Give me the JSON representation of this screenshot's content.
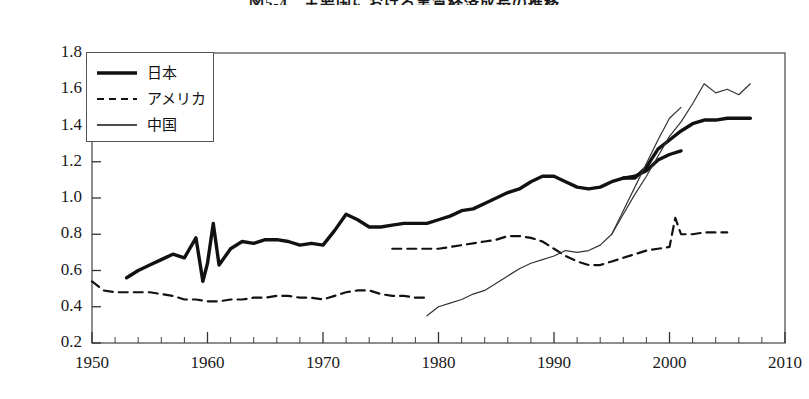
{
  "chart_data": {
    "type": "line",
    "title": "図5-4　主要国における実質経済成長の推移",
    "xlabel": "",
    "ylabel": "",
    "xlim": [
      1950,
      2010
    ],
    "ylim": [
      0.2,
      1.8
    ],
    "x_ticks": [
      1950,
      1960,
      1970,
      1980,
      1990,
      2000,
      2010
    ],
    "x_tick_labels": [
      "1950",
      "1960",
      "1970",
      "1980",
      "1990",
      "2000",
      "2010"
    ],
    "x_minor_tick_step": 2,
    "y_ticks": [
      0.2,
      0.4,
      0.6,
      0.8,
      1.0,
      1.2,
      1.4,
      1.6,
      1.8
    ],
    "y_tick_labels": [
      "0.2",
      "0.4",
      "0.6",
      "0.8",
      "1.0",
      "1.2",
      "1.4",
      "1.6",
      "1.8"
    ],
    "grid": false,
    "legend_position": "upper-left",
    "series": [
      {
        "name": "日本",
        "style": "solid-thick",
        "color": "#111111",
        "width": 3.4,
        "points": [
          [
            1953,
            0.56
          ],
          [
            1954,
            0.6
          ],
          [
            1955,
            0.63
          ],
          [
            1956,
            0.66
          ],
          [
            1957,
            0.69
          ],
          [
            1958,
            0.67
          ],
          [
            1959,
            0.78
          ],
          [
            1959.6,
            0.54
          ],
          [
            1960,
            0.64
          ],
          [
            1960.5,
            0.86
          ],
          [
            1961,
            0.63
          ],
          [
            1962,
            0.72
          ],
          [
            1963,
            0.76
          ],
          [
            1964,
            0.75
          ],
          [
            1965,
            0.77
          ],
          [
            1966,
            0.77
          ],
          [
            1967,
            0.76
          ],
          [
            1968,
            0.74
          ],
          [
            1969,
            0.75
          ],
          [
            1970,
            0.74
          ],
          [
            1971,
            0.82
          ],
          [
            1972,
            0.91
          ],
          [
            1973,
            0.88
          ],
          [
            1974,
            0.84
          ],
          [
            1975,
            0.84
          ],
          [
            1976,
            0.85
          ],
          [
            1977,
            0.86
          ],
          [
            1978,
            0.86
          ],
          [
            1979,
            0.86
          ],
          [
            1980,
            0.88
          ],
          [
            1981,
            0.9
          ],
          [
            1982,
            0.93
          ],
          [
            1983,
            0.94
          ],
          [
            1984,
            0.97
          ],
          [
            1985,
            1.0
          ],
          [
            1986,
            1.03
          ],
          [
            1987,
            1.05
          ],
          [
            1988,
            1.09
          ],
          [
            1989,
            1.12
          ],
          [
            1990,
            1.12
          ],
          [
            1991,
            1.09
          ],
          [
            1992,
            1.06
          ],
          [
            1993,
            1.05
          ],
          [
            1994,
            1.06
          ],
          [
            1995,
            1.09
          ],
          [
            1996,
            1.11
          ],
          [
            1997,
            1.11
          ],
          [
            1998,
            1.17
          ],
          [
            1999,
            1.27
          ],
          [
            2000,
            1.32
          ],
          [
            2001,
            1.37
          ],
          [
            2002,
            1.41
          ],
          [
            2003,
            1.43
          ],
          [
            2004,
            1.43
          ],
          [
            2005,
            1.44
          ],
          [
            2006,
            1.44
          ],
          [
            2007,
            1.44
          ]
        ]
      },
      {
        "name": "日本",
        "style": "solid-thick",
        "color": "#111111",
        "width": 3.4,
        "points": [
          [
            1996,
            1.11
          ],
          [
            1997,
            1.12
          ],
          [
            1998,
            1.15
          ],
          [
            1999,
            1.21
          ],
          [
            2000,
            1.24
          ],
          [
            2001,
            1.26
          ]
        ]
      },
      {
        "name": "アメリカ",
        "style": "dashed",
        "color": "#111111",
        "width": 2.2,
        "points": [
          [
            1950,
            0.54
          ],
          [
            1951,
            0.49
          ],
          [
            1952,
            0.48
          ],
          [
            1953,
            0.48
          ],
          [
            1954,
            0.48
          ],
          [
            1955,
            0.48
          ],
          [
            1956,
            0.47
          ],
          [
            1957,
            0.46
          ],
          [
            1958,
            0.44
          ],
          [
            1959,
            0.44
          ],
          [
            1960,
            0.43
          ],
          [
            1961,
            0.43
          ],
          [
            1962,
            0.44
          ],
          [
            1963,
            0.44
          ],
          [
            1964,
            0.45
          ],
          [
            1965,
            0.45
          ],
          [
            1966,
            0.46
          ],
          [
            1967,
            0.46
          ],
          [
            1968,
            0.45
          ],
          [
            1969,
            0.45
          ],
          [
            1970,
            0.44
          ],
          [
            1971,
            0.46
          ],
          [
            1972,
            0.48
          ],
          [
            1973,
            0.49
          ],
          [
            1974,
            0.49
          ],
          [
            1975,
            0.47
          ],
          [
            1976,
            0.46
          ],
          [
            1977,
            0.46
          ],
          [
            1978,
            0.45
          ],
          [
            1979,
            0.45
          ]
        ]
      },
      {
        "name": "アメリカ",
        "style": "dashed",
        "color": "#111111",
        "width": 2.2,
        "points": [
          [
            1976,
            0.72
          ],
          [
            1977,
            0.72
          ],
          [
            1978,
            0.72
          ],
          [
            1979,
            0.72
          ],
          [
            1980,
            0.72
          ],
          [
            1981,
            0.73
          ],
          [
            1982,
            0.74
          ],
          [
            1983,
            0.75
          ],
          [
            1984,
            0.76
          ],
          [
            1985,
            0.77
          ],
          [
            1986,
            0.79
          ],
          [
            1987,
            0.79
          ],
          [
            1988,
            0.78
          ],
          [
            1989,
            0.76
          ],
          [
            1990,
            0.72
          ],
          [
            1991,
            0.68
          ],
          [
            1992,
            0.65
          ],
          [
            1993,
            0.63
          ],
          [
            1994,
            0.63
          ],
          [
            1995,
            0.65
          ],
          [
            1996,
            0.67
          ],
          [
            1997,
            0.69
          ],
          [
            1998,
            0.71
          ],
          [
            1999,
            0.72
          ],
          [
            2000,
            0.73
          ],
          [
            2000.5,
            0.89
          ],
          [
            2001,
            0.8
          ],
          [
            2002,
            0.8
          ],
          [
            2003,
            0.81
          ],
          [
            2004,
            0.81
          ],
          [
            2005,
            0.81
          ]
        ]
      },
      {
        "name": "中国",
        "style": "solid-thin",
        "color": "#333333",
        "width": 1.2,
        "points": [
          [
            1979,
            0.35
          ],
          [
            1980,
            0.4
          ],
          [
            1981,
            0.42
          ],
          [
            1982,
            0.44
          ],
          [
            1983,
            0.47
          ],
          [
            1984,
            0.49
          ],
          [
            1985,
            0.53
          ],
          [
            1986,
            0.57
          ],
          [
            1987,
            0.61
          ],
          [
            1988,
            0.64
          ],
          [
            1989,
            0.66
          ],
          [
            1990,
            0.68
          ],
          [
            1991,
            0.71
          ],
          [
            1992,
            0.7
          ],
          [
            1993,
            0.71
          ],
          [
            1994,
            0.74
          ],
          [
            1995,
            0.8
          ],
          [
            1996,
            0.91
          ],
          [
            1997,
            1.02
          ],
          [
            1998,
            1.12
          ],
          [
            1999,
            1.23
          ],
          [
            2000,
            1.34
          ],
          [
            2001,
            1.42
          ],
          [
            2002,
            1.52
          ],
          [
            2003,
            1.63
          ],
          [
            2004,
            1.58
          ],
          [
            2005,
            1.6
          ],
          [
            2006,
            1.57
          ],
          [
            2007,
            1.63
          ]
        ]
      },
      {
        "name": "中国",
        "style": "solid-thin",
        "color": "#333333",
        "width": 1.2,
        "points": [
          [
            1995,
            0.8
          ],
          [
            1996,
            0.93
          ],
          [
            1997,
            1.06
          ],
          [
            1998,
            1.19
          ],
          [
            1999,
            1.32
          ],
          [
            2000,
            1.44
          ],
          [
            2001,
            1.5
          ]
        ]
      }
    ],
    "legend": [
      {
        "label": "日本",
        "style": "solid-thick"
      },
      {
        "label": "アメリカ",
        "style": "dashed"
      },
      {
        "label": "中国",
        "style": "solid-thin"
      }
    ]
  }
}
